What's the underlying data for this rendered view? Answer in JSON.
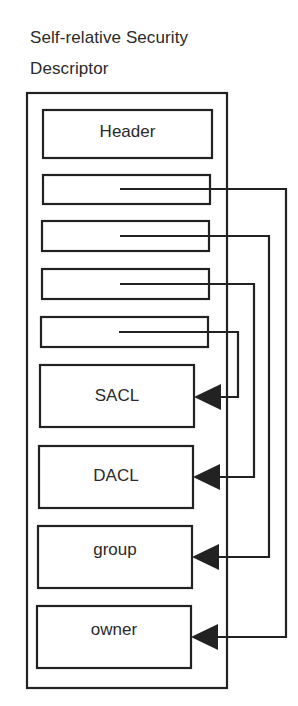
{
  "title": {
    "line1": "Self-relative  Security",
    "line2": "Descriptor"
  },
  "colors": {
    "stroke": "#222222",
    "background": "#ffffff"
  },
  "descriptor": {
    "header_label": "Header",
    "pointer_slots": [
      {
        "target": "owner"
      },
      {
        "target": "group"
      },
      {
        "target": "DACL"
      },
      {
        "target": "SACL"
      }
    ],
    "blocks": [
      {
        "label": "SACL"
      },
      {
        "label": "DACL"
      },
      {
        "label": "group"
      },
      {
        "label": "owner"
      }
    ]
  }
}
